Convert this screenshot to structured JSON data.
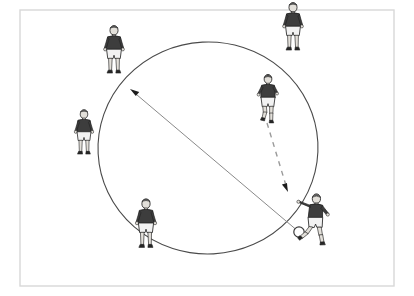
{
  "figure": {
    "background_color": "#ffffff",
    "frame": {
      "name": "diagram-frame",
      "stroke_color": "#d8d8d8",
      "fill_color": "#ffffff",
      "x": 20,
      "y": 10,
      "width": 374,
      "height": 276,
      "stroke_width": 1.4
    },
    "circle": {
      "name": "pitch-circle",
      "label": "Centre circle",
      "stroke_color": "#4a4a4a",
      "fill": "none",
      "center_x": 208,
      "center_y": 148,
      "radius_x": 110,
      "radius_y": 106,
      "rotation_deg": -3,
      "stroke_width": 1.1
    },
    "ball": {
      "name": "soccer-ball",
      "label": "Ball",
      "x": 299,
      "y": 232,
      "radius": 5.2,
      "fill_color": "#ffffff",
      "stroke_color": "#3a3a3a"
    },
    "arrows": [
      {
        "name": "pass-arrow",
        "label": "Long pass across the circle",
        "style": "solid",
        "meaning": "Path of the ball",
        "color": "#8a8a8a",
        "x1": 299,
        "y1": 232,
        "x2": 130,
        "y2": 89,
        "stroke_width": 1.0,
        "head_color": "#1c1c1c"
      },
      {
        "name": "run-arrow",
        "label": "Supporting run",
        "style": "dashed",
        "meaning": "Path of the player",
        "color": "#9a9a9a",
        "x1": 267,
        "y1": 123,
        "x2": 288,
        "y2": 192,
        "stroke_width": 1.4,
        "dash_pattern": "5 5",
        "head_color": "#1c1c1c"
      }
    ],
    "players": [
      {
        "name": "player-top-left",
        "label": "Player 1",
        "position_note": "Outside circle, upper left",
        "x": 114,
        "y": 58,
        "scale": 0.92,
        "pose": "standing",
        "shirt_color": "#3d3d3d",
        "shorts_color": "#f2f2f2",
        "skin_color": "#e3e0da",
        "has_ball": false
      },
      {
        "name": "player-top-right",
        "label": "Player 2",
        "position_note": "Outside circle, upper right",
        "x": 293,
        "y": 35,
        "scale": 0.92,
        "pose": "standing",
        "shirt_color": "#3d3d3d",
        "shorts_color": "#f2f2f2",
        "skin_color": "#e3e0da",
        "has_ball": false
      },
      {
        "name": "player-left",
        "label": "Player 3",
        "position_note": "Outside circle, left side",
        "x": 84,
        "y": 140,
        "scale": 0.86,
        "pose": "standing",
        "shirt_color": "#3d3d3d",
        "shorts_color": "#f2f2f2",
        "skin_color": "#e3e0da",
        "has_ball": false
      },
      {
        "name": "player-bottom-left",
        "label": "Player 4",
        "position_note": "On the circle, lower left",
        "x": 146,
        "y": 232,
        "scale": 0.94,
        "pose": "standing",
        "shirt_color": "#3d3d3d",
        "shorts_color": "#f2f2f2",
        "skin_color": "#e3e0da",
        "has_ball": false
      },
      {
        "name": "player-runner-inside",
        "label": "Player 5",
        "position_note": "Inside circle, right side, running",
        "x": 268,
        "y": 106,
        "scale": 0.9,
        "pose": "running",
        "shirt_color": "#3d3d3d",
        "shorts_color": "#f2f2f2",
        "skin_color": "#e3e0da",
        "has_ball": false
      },
      {
        "name": "player-kicker",
        "label": "Player 6",
        "position_note": "On the circle, lower right, striking the ball",
        "x": 315,
        "y": 226,
        "scale": 0.94,
        "pose": "kicking",
        "shirt_color": "#3d3d3d",
        "shorts_color": "#f2f2f2",
        "skin_color": "#e3e0da",
        "has_ball": true
      }
    ]
  }
}
